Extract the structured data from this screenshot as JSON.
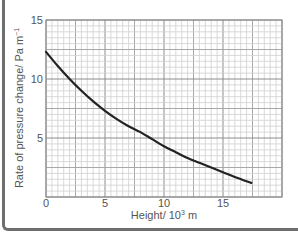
{
  "chart_data": {
    "type": "line",
    "title": "",
    "xlabel": "Height/ 10³ m",
    "ylabel": "Rate of pressure change/ Pa m⁻¹",
    "xlim": [
      0,
      20
    ],
    "ylim": [
      0,
      15
    ],
    "xticks": [
      0,
      5,
      10,
      15
    ],
    "yticks": [
      5,
      10,
      15
    ],
    "xtick_labels": [
      "0",
      "5",
      "10",
      "15"
    ],
    "ytick_labels": [
      "5",
      "10",
      "15"
    ],
    "grid": {
      "on": true,
      "minor_step": 0.5,
      "medium_step": 2.5,
      "major_step": 5
    },
    "legend": null,
    "series": [
      {
        "name": "rate of pressure change",
        "color": "#222222",
        "x": [
          0,
          1,
          2,
          3,
          4,
          5,
          6,
          7,
          8,
          9,
          10,
          11,
          12,
          13,
          14,
          15,
          16,
          17.4
        ],
        "y": [
          12.3,
          11.1,
          10.0,
          9.0,
          8.1,
          7.3,
          6.6,
          6.0,
          5.5,
          4.9,
          4.3,
          3.8,
          3.3,
          2.9,
          2.5,
          2.1,
          1.7,
          1.2
        ]
      }
    ]
  },
  "labels": {
    "x_axis": "Height/ 10",
    "x_axis_sup": "3",
    "x_axis_unit": " m",
    "y_axis": "Rate of pressure change/ Pa m",
    "y_axis_sup": "−1"
  }
}
